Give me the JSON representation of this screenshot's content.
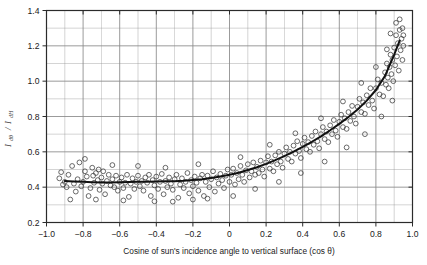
{
  "figure": {
    "background_color": "#ffffff",
    "frame_color": "#2b2b2b",
    "grid_color": "#8a8a8a",
    "marker_color": "#3a3a3a",
    "curve_color": "#111111"
  },
  "chart_data": {
    "type": "scatter",
    "title": "",
    "subtitle": "",
    "xlabel": "Cosine of sun's incidence angle to vertical surface (cos θ)",
    "ylabel": "I dθ / I dH",
    "ylabel_numerator": "I",
    "ylabel_numerator_sub": "dθ",
    "ylabel_denominator": "I",
    "ylabel_denominator_sub": "dH",
    "xlim": [
      -1.0,
      1.0
    ],
    "ylim": [
      0.2,
      1.4
    ],
    "xticks": [
      -1.0,
      -0.8,
      -0.6,
      -0.4,
      -0.2,
      0,
      0.2,
      0.4,
      0.6,
      0.8,
      1.0
    ],
    "xtick_labels": [
      "-1.0",
      "-0.8",
      "-0.6",
      "-0.4",
      "-0.2",
      "0",
      "0.2",
      "0.4",
      "0.6",
      "0.8",
      "1.0"
    ],
    "yticks": [
      0.2,
      0.4,
      0.6,
      0.8,
      1.0,
      1.2,
      1.4
    ],
    "ytick_labels": [
      "0.2",
      "0.4",
      "0.6",
      "0.8",
      "1.0",
      "1.2",
      "1.4"
    ],
    "x_minor_step": 0.1,
    "y_minor_step": 0.1,
    "grid": true,
    "grid_minor": true,
    "legend": null,
    "legend_position": "none",
    "marker": "open-circle",
    "marker_size": 2.4,
    "fit_curve": {
      "name": "fitted mean curve",
      "style": "solid-bold",
      "x": [
        -0.9,
        -0.85,
        -0.8,
        -0.75,
        -0.7,
        -0.65,
        -0.6,
        -0.55,
        -0.5,
        -0.45,
        -0.4,
        -0.35,
        -0.3,
        -0.25,
        -0.2,
        -0.15,
        -0.1,
        -0.05,
        0.0,
        0.05,
        0.1,
        0.15,
        0.2,
        0.25,
        0.3,
        0.35,
        0.4,
        0.45,
        0.5,
        0.55,
        0.6,
        0.65,
        0.7,
        0.75,
        0.8,
        0.85,
        0.9,
        0.93
      ],
      "y": [
        0.435,
        0.432,
        0.43,
        0.428,
        0.427,
        0.427,
        0.428,
        0.429,
        0.43,
        0.431,
        0.432,
        0.433,
        0.434,
        0.436,
        0.44,
        0.445,
        0.452,
        0.46,
        0.47,
        0.482,
        0.497,
        0.513,
        0.532,
        0.553,
        0.576,
        0.601,
        0.628,
        0.657,
        0.688,
        0.722,
        0.758,
        0.797,
        0.84,
        0.89,
        0.95,
        1.03,
        1.15,
        1.23
      ]
    },
    "points": [
      [
        -0.93,
        0.45
      ],
      [
        -0.9,
        0.43
      ],
      [
        -0.89,
        0.4
      ],
      [
        -0.88,
        0.47
      ],
      [
        -0.86,
        0.52
      ],
      [
        -0.85,
        0.42
      ],
      [
        -0.84,
        0.375
      ],
      [
        -0.83,
        0.445
      ],
      [
        -0.82,
        0.54
      ],
      [
        -0.81,
        0.405
      ],
      [
        -0.8,
        0.43
      ],
      [
        -0.79,
        0.49
      ],
      [
        -0.78,
        0.46
      ],
      [
        -0.77,
        0.35
      ],
      [
        -0.76,
        0.395
      ],
      [
        -0.75,
        0.51
      ],
      [
        -0.745,
        0.465
      ],
      [
        -0.74,
        0.425
      ],
      [
        -0.73,
        0.48
      ],
      [
        -0.72,
        0.44
      ],
      [
        -0.715,
        0.5
      ],
      [
        -0.71,
        0.385
      ],
      [
        -0.7,
        0.455
      ],
      [
        -0.695,
        0.42
      ],
      [
        -0.69,
        0.49
      ],
      [
        -0.68,
        0.36
      ],
      [
        -0.67,
        0.435
      ],
      [
        -0.66,
        0.47
      ],
      [
        -0.65,
        0.41
      ],
      [
        -0.64,
        0.445
      ],
      [
        -0.63,
        0.4
      ],
      [
        -0.62,
        0.465
      ],
      [
        -0.61,
        0.38
      ],
      [
        -0.6,
        0.43
      ],
      [
        -0.59,
        0.455
      ],
      [
        -0.58,
        0.395
      ],
      [
        -0.57,
        0.425
      ],
      [
        -0.56,
        0.47
      ],
      [
        -0.55,
        0.345
      ],
      [
        -0.54,
        0.42
      ],
      [
        -0.53,
        0.45
      ],
      [
        -0.52,
        0.39
      ],
      [
        -0.51,
        0.43
      ],
      [
        -0.5,
        0.465
      ],
      [
        -0.49,
        0.405
      ],
      [
        -0.48,
        0.435
      ],
      [
        -0.47,
        0.38
      ],
      [
        -0.46,
        0.455
      ],
      [
        -0.45,
        0.425
      ],
      [
        -0.44,
        0.47
      ],
      [
        -0.43,
        0.35
      ],
      [
        -0.42,
        0.44
      ],
      [
        -0.41,
        0.41
      ],
      [
        -0.4,
        0.46
      ],
      [
        -0.39,
        0.39
      ],
      [
        -0.38,
        0.43
      ],
      [
        -0.37,
        0.475
      ],
      [
        -0.36,
        0.36
      ],
      [
        -0.35,
        0.435
      ],
      [
        -0.34,
        0.4
      ],
      [
        -0.33,
        0.455
      ],
      [
        -0.32,
        0.42
      ],
      [
        -0.31,
        0.385
      ],
      [
        -0.3,
        0.445
      ],
      [
        -0.29,
        0.47
      ],
      [
        -0.28,
        0.34
      ],
      [
        -0.27,
        0.415
      ],
      [
        -0.26,
        0.45
      ],
      [
        -0.25,
        0.395
      ],
      [
        -0.24,
        0.43
      ],
      [
        -0.23,
        0.48
      ],
      [
        -0.22,
        0.365
      ],
      [
        -0.21,
        0.44
      ],
      [
        -0.2,
        0.405
      ],
      [
        -0.19,
        0.46
      ],
      [
        -0.18,
        0.425
      ],
      [
        -0.17,
        0.38
      ],
      [
        -0.16,
        0.45
      ],
      [
        -0.15,
        0.47
      ],
      [
        -0.14,
        0.35
      ],
      [
        -0.13,
        0.43
      ],
      [
        -0.12,
        0.465
      ],
      [
        -0.11,
        0.4
      ],
      [
        -0.1,
        0.445
      ],
      [
        -0.09,
        0.49
      ],
      [
        -0.08,
        0.375
      ],
      [
        -0.07,
        0.455
      ],
      [
        -0.06,
        0.42
      ],
      [
        -0.05,
        0.475
      ],
      [
        -0.04,
        0.44
      ],
      [
        -0.03,
        0.395
      ],
      [
        -0.02,
        0.465
      ],
      [
        -0.01,
        0.5
      ],
      [
        0.0,
        0.43
      ],
      [
        0.01,
        0.47
      ],
      [
        0.02,
        0.505
      ],
      [
        0.03,
        0.415
      ],
      [
        0.04,
        0.48
      ],
      [
        0.05,
        0.445
      ],
      [
        0.06,
        0.52
      ],
      [
        0.07,
        0.47
      ],
      [
        0.08,
        0.43
      ],
      [
        0.09,
        0.495
      ],
      [
        0.1,
        0.53
      ],
      [
        0.11,
        0.455
      ],
      [
        0.12,
        0.49
      ],
      [
        0.13,
        0.54
      ],
      [
        0.14,
        0.47
      ],
      [
        0.15,
        0.515
      ],
      [
        0.16,
        0.48
      ],
      [
        0.17,
        0.55
      ],
      [
        0.18,
        0.5
      ],
      [
        0.19,
        0.46
      ],
      [
        0.2,
        0.54
      ],
      [
        0.21,
        0.575
      ],
      [
        0.22,
        0.505
      ],
      [
        0.23,
        0.545
      ],
      [
        0.24,
        0.49
      ],
      [
        0.25,
        0.58
      ],
      [
        0.26,
        0.53
      ],
      [
        0.27,
        0.6
      ],
      [
        0.28,
        0.545
      ],
      [
        0.29,
        0.51
      ],
      [
        0.3,
        0.59
      ],
      [
        0.31,
        0.625
      ],
      [
        0.32,
        0.56
      ],
      [
        0.33,
        0.6
      ],
      [
        0.34,
        0.545
      ],
      [
        0.35,
        0.635
      ],
      [
        0.36,
        0.59
      ],
      [
        0.37,
        0.66
      ],
      [
        0.38,
        0.605
      ],
      [
        0.39,
        0.565
      ],
      [
        0.4,
        0.645
      ],
      [
        0.41,
        0.68
      ],
      [
        0.42,
        0.615
      ],
      [
        0.43,
        0.655
      ],
      [
        0.44,
        0.6
      ],
      [
        0.45,
        0.69
      ],
      [
        0.46,
        0.64
      ],
      [
        0.47,
        0.715
      ],
      [
        0.48,
        0.66
      ],
      [
        0.49,
        0.62
      ],
      [
        0.5,
        0.7
      ],
      [
        0.51,
        0.74
      ],
      [
        0.52,
        0.672
      ],
      [
        0.53,
        0.715
      ],
      [
        0.54,
        0.655
      ],
      [
        0.55,
        0.75
      ],
      [
        0.56,
        0.7
      ],
      [
        0.57,
        0.78
      ],
      [
        0.58,
        0.72
      ],
      [
        0.59,
        0.685
      ],
      [
        0.6,
        0.77
      ],
      [
        0.61,
        0.81
      ],
      [
        0.62,
        0.74
      ],
      [
        0.63,
        0.79
      ],
      [
        0.64,
        0.73
      ],
      [
        0.65,
        0.825
      ],
      [
        0.66,
        0.775
      ],
      [
        0.67,
        0.86
      ],
      [
        0.68,
        0.8
      ],
      [
        0.69,
        0.76
      ],
      [
        0.7,
        0.855
      ],
      [
        0.71,
        0.9
      ],
      [
        0.72,
        0.825
      ],
      [
        0.73,
        0.88
      ],
      [
        0.74,
        0.815
      ],
      [
        0.75,
        0.92
      ],
      [
        0.76,
        0.865
      ],
      [
        0.77,
        0.96
      ],
      [
        0.78,
        0.89
      ],
      [
        0.79,
        0.845
      ],
      [
        0.8,
        0.96
      ],
      [
        0.81,
        1.01
      ],
      [
        0.82,
        0.925
      ],
      [
        0.83,
        0.99
      ],
      [
        0.84,
        0.915
      ],
      [
        0.85,
        1.05
      ],
      [
        0.855,
        0.98
      ],
      [
        0.86,
        1.1
      ],
      [
        0.865,
        1.02
      ],
      [
        0.87,
        0.96
      ],
      [
        0.875,
        1.08
      ],
      [
        0.88,
        1.15
      ],
      [
        0.885,
        1.04
      ],
      [
        0.89,
        1.12
      ],
      [
        0.895,
        1.0
      ],
      [
        0.9,
        1.19
      ],
      [
        0.905,
        1.09
      ],
      [
        0.91,
        1.26
      ],
      [
        0.915,
        1.14
      ],
      [
        0.92,
        1.215
      ],
      [
        0.925,
        1.06
      ],
      [
        0.93,
        1.29
      ],
      [
        0.935,
        1.175
      ],
      [
        0.94,
        1.24
      ],
      [
        0.945,
        1.12
      ],
      [
        0.95,
        1.2
      ],
      [
        -0.87,
        0.33
      ],
      [
        -0.73,
        0.33
      ],
      [
        -0.58,
        0.325
      ],
      [
        -0.41,
        0.32
      ],
      [
        -0.31,
        0.318
      ],
      [
        -0.2,
        0.33
      ],
      [
        -0.12,
        0.335
      ],
      [
        0.02,
        0.35
      ],
      [
        0.14,
        0.39
      ],
      [
        0.27,
        0.43
      ],
      [
        0.39,
        0.48
      ],
      [
        0.52,
        0.545
      ],
      [
        0.64,
        0.625
      ],
      [
        0.74,
        0.7
      ],
      [
        0.83,
        0.8
      ],
      [
        0.89,
        0.89
      ],
      [
        -0.79,
        0.56
      ],
      [
        -0.64,
        0.525
      ],
      [
        -0.5,
        0.52
      ],
      [
        -0.35,
        0.51
      ],
      [
        -0.17,
        0.53
      ],
      [
        0.06,
        0.57
      ],
      [
        0.22,
        0.64
      ],
      [
        0.36,
        0.705
      ],
      [
        0.5,
        0.79
      ],
      [
        0.62,
        0.885
      ],
      [
        0.72,
        0.99
      ],
      [
        0.8,
        1.08
      ],
      [
        0.86,
        1.18
      ],
      [
        0.91,
        1.33
      ],
      [
        0.88,
        1.27
      ],
      [
        0.93,
        1.35
      ],
      [
        -0.92,
        0.485
      ],
      [
        -0.91,
        0.415
      ],
      [
        0.945,
        1.3
      ],
      [
        0.95,
        1.26
      ]
    ]
  }
}
